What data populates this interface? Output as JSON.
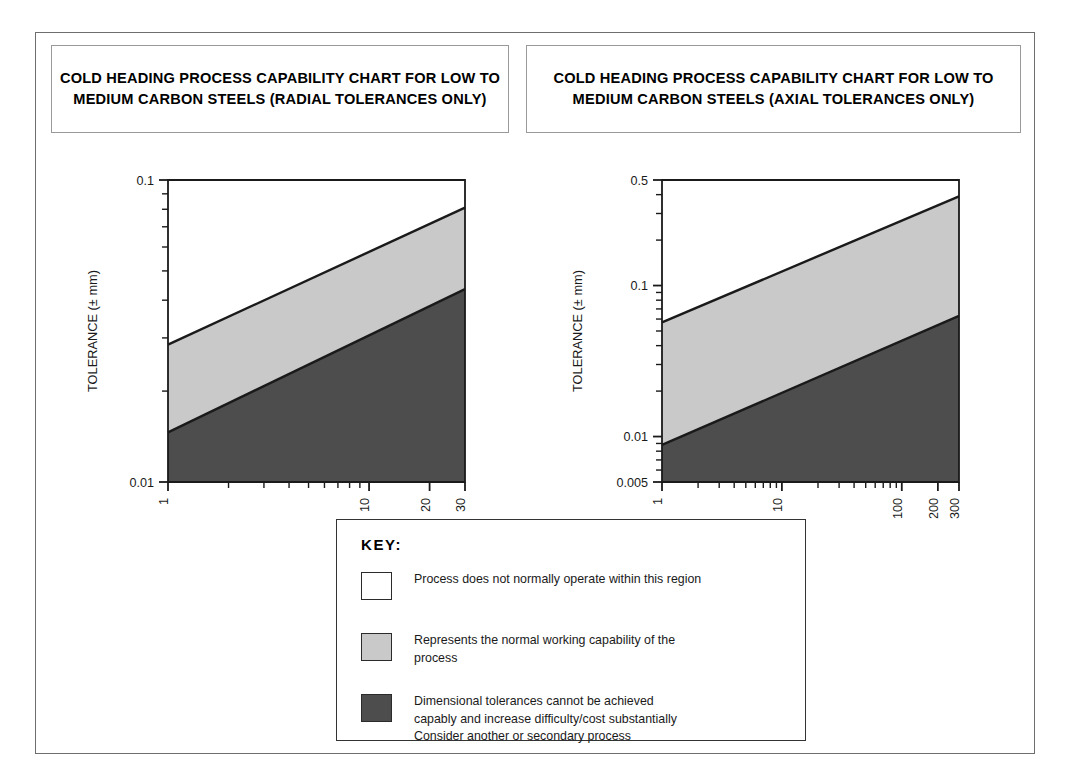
{
  "figure": {
    "frame_color": "#6e6e6e",
    "background": "#ffffff"
  },
  "titles": {
    "left": "COLD HEADING PROCESS CAPABILITY\nCHART FOR LOW TO MEDIUM CARBON STEELS\n(RADIAL TOLERANCES ONLY)",
    "right": "COLD HEADING PROCESS CAPABILITY CHART\nFOR LOW TO MEDIUM CARBON STEELS\n(AXIAL TOLERANCES ONLY)"
  },
  "key": {
    "title": "KEY:",
    "items": [
      {
        "swatch": "white",
        "color": "#ffffff",
        "text": "Process does not normally operate within this region"
      },
      {
        "swatch": "light-gray",
        "color": "#c9c9c9",
        "text": "Represents the normal working capability of the\nprocess"
      },
      {
        "swatch": "dark-gray",
        "color": "#4d4d4d",
        "text": "Dimensional tolerances cannot be achieved\ncapably and increase difficulty/cost substantially\nConsider another or secondary process"
      }
    ]
  },
  "colors": {
    "band_upper_white": "#ffffff",
    "band_middle_light": "#c9c9c9",
    "band_lower_dark": "#4d4d4d",
    "axis": "#1a1a1a",
    "boundary_line": "#1a1a1a"
  },
  "chart_data": [
    {
      "id": "radial",
      "type": "area",
      "title": "COLD HEADING PROCESS CAPABILITY CHART FOR LOW TO MEDIUM CARBON STEELS (RADIAL TOLERANCES ONLY)",
      "xlabel": "DIAMETER (mm)",
      "ylabel": "TOLERANCE (± mm)",
      "xscale": "log",
      "yscale": "log",
      "xlim": [
        1,
        30
      ],
      "ylim": [
        0.01,
        0.1
      ],
      "xticks": [
        1,
        2,
        3,
        4,
        5,
        6,
        7,
        8,
        9,
        10,
        20,
        30
      ],
      "xtick_labels": [
        {
          "value": 1,
          "label": "1"
        },
        {
          "value": 10,
          "label": "10"
        },
        {
          "value": 20,
          "label": "20"
        },
        {
          "value": 30,
          "label": "30"
        }
      ],
      "yticks": [
        0.01,
        0.02,
        0.03,
        0.04,
        0.05,
        0.06,
        0.07,
        0.08,
        0.09,
        0.1
      ],
      "ytick_labels": [
        {
          "value": 0.01,
          "label": "0.01"
        },
        {
          "value": 0.1,
          "label": "0.1"
        }
      ],
      "grid": false,
      "legend": "external-key",
      "series": [
        {
          "name": "upper boundary (top of normal working capability)",
          "x": [
            1,
            30
          ],
          "y": [
            0.0285,
            0.081
          ]
        },
        {
          "name": "lower boundary (bottom of normal working capability)",
          "x": [
            1,
            30
          ],
          "y": [
            0.0146,
            0.0435
          ]
        }
      ],
      "regions": [
        {
          "name": "process does not normally operate",
          "fill": "#ffffff",
          "above": "upper boundary (top of normal working capability)"
        },
        {
          "name": "normal working capability",
          "fill": "#c9c9c9",
          "between": [
            "lower boundary (bottom of normal working capability)",
            "upper boundary (top of normal working capability)"
          ]
        },
        {
          "name": "tolerances not capably achievable",
          "fill": "#4d4d4d",
          "below": "lower boundary (bottom of normal working capability)"
        }
      ]
    },
    {
      "id": "axial",
      "type": "area",
      "title": "COLD HEADING PROCESS CAPABILITY CHART FOR LOW TO MEDIUM CARBON STEELS (AXIAL TOLERANCES ONLY)",
      "xlabel": "DIMENSION (mm)",
      "ylabel": "TOLERANCE (± mm)",
      "xscale": "log",
      "yscale": "log",
      "xlim": [
        1,
        300
      ],
      "ylim": [
        0.005,
        0.5
      ],
      "xticks": [
        1,
        2,
        3,
        4,
        5,
        6,
        7,
        8,
        9,
        10,
        20,
        30,
        40,
        50,
        60,
        70,
        80,
        90,
        100,
        200,
        300
      ],
      "xtick_labels": [
        {
          "value": 1,
          "label": "1"
        },
        {
          "value": 10,
          "label": "10"
        },
        {
          "value": 100,
          "label": "100"
        },
        {
          "value": 200,
          "label": "200"
        },
        {
          "value": 300,
          "label": "300"
        }
      ],
      "yticks": [
        0.005,
        0.006,
        0.007,
        0.008,
        0.009,
        0.01,
        0.02,
        0.03,
        0.04,
        0.05,
        0.06,
        0.07,
        0.08,
        0.09,
        0.1,
        0.2,
        0.3,
        0.4,
        0.5
      ],
      "ytick_labels": [
        {
          "value": 0.005,
          "label": "0.005"
        },
        {
          "value": 0.01,
          "label": "0.01"
        },
        {
          "value": 0.1,
          "label": "0.1"
        },
        {
          "value": 0.5,
          "label": "0.5"
        }
      ],
      "grid": false,
      "legend": "external-key",
      "series": [
        {
          "name": "upper boundary (top of normal working capability)",
          "x": [
            1,
            300
          ],
          "y": [
            0.057,
            0.39
          ]
        },
        {
          "name": "lower boundary (bottom of normal working capability)",
          "x": [
            1,
            300
          ],
          "y": [
            0.0088,
            0.063
          ]
        }
      ],
      "regions": [
        {
          "name": "process does not normally operate",
          "fill": "#ffffff",
          "above": "upper boundary (top of normal working capability)"
        },
        {
          "name": "normal working capability",
          "fill": "#c9c9c9",
          "between": [
            "lower boundary (bottom of normal working capability)",
            "upper boundary (top of normal working capability)"
          ]
        },
        {
          "name": "tolerances not capably achievable",
          "fill": "#4d4d4d",
          "below": "lower boundary (bottom of normal working capability)"
        }
      ]
    }
  ]
}
